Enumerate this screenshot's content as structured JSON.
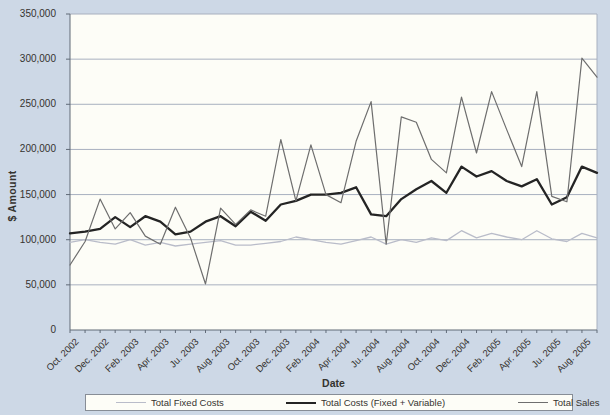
{
  "colors": {
    "background": "#cdd8e6",
    "plot_background": "#fdfdf7",
    "gridline": "#a8b0bf",
    "axis": "#606a77",
    "text": "#35332f",
    "legend_border": "#878d96"
  },
  "chart_data": {
    "type": "line",
    "title": "",
    "xlabel": "Date",
    "ylabel": "$ Amount",
    "ylim": [
      0,
      350000
    ],
    "ytick_step": 50000,
    "ytick_labels": [
      "0",
      "50,000",
      "100,000",
      "150,000",
      "200,000",
      "250,000",
      "300,000",
      "350,000"
    ],
    "grid": "horizontal",
    "legend_position": "bottom",
    "n_points": 36,
    "points_per_labeled_tick": 2,
    "x_tick_labels": [
      "Oct. 2002",
      "Dec. 2002",
      "Feb. 2003",
      "Apr. 2003",
      "Ju. 2003",
      "Aug. 2003",
      "Oct. 2003",
      "Dec. 2003",
      "Feb. 2004",
      "Apr. 2004",
      "Ju. 2004",
      "Aug. 2004",
      "Oct. 2004",
      "Dec. 2004",
      "Feb. 2005",
      "Apr. 2005",
      "Ju. 2005",
      "Aug. 2005"
    ],
    "series": [
      {
        "name": "Total Fixed Costs",
        "color": "#b9bcc9",
        "width": 1.3,
        "values": [
          97000,
          100000,
          97000,
          95000,
          100000,
          94000,
          97000,
          93000,
          95000,
          97000,
          99000,
          94000,
          94000,
          96000,
          98000,
          103000,
          100000,
          97000,
          95000,
          99000,
          103000,
          95000,
          100000,
          97000,
          102000,
          99000,
          110000,
          102000,
          107000,
          103000,
          100000,
          110000,
          101000,
          98000,
          107000,
          102000
        ]
      },
      {
        "name": "Total Costs (Fixed + Variable)",
        "color": "#242424",
        "width": 2.3,
        "values": [
          107000,
          109000,
          112000,
          125000,
          114000,
          126000,
          120000,
          106000,
          109000,
          120000,
          126000,
          115000,
          131000,
          121000,
          139000,
          143000,
          150000,
          150000,
          152000,
          158000,
          128000,
          126000,
          145000,
          156000,
          165000,
          152000,
          181000,
          170000,
          176000,
          165000,
          159000,
          167000,
          139000,
          147000,
          181000,
          174000
        ]
      },
      {
        "name": "Total Sales",
        "color": "#6e6e6e",
        "width": 1.2,
        "values": [
          72000,
          98000,
          145000,
          112000,
          130000,
          104000,
          95000,
          136000,
          102000,
          51000,
          135000,
          117000,
          133000,
          126000,
          211000,
          143000,
          205000,
          150000,
          141000,
          209000,
          253000,
          95000,
          236000,
          230000,
          189000,
          174000,
          258000,
          196000,
          264000,
          222000,
          181000,
          264000,
          148000,
          142000,
          301000,
          280000
        ]
      }
    ]
  }
}
